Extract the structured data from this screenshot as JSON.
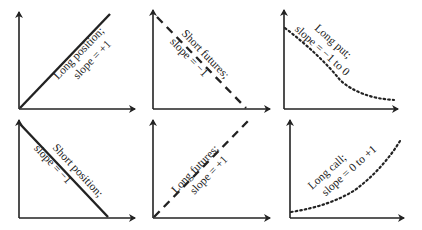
{
  "colors": {
    "ink": "#222222",
    "background": "#ffffff"
  },
  "panels": [
    {
      "id": "long-position",
      "line_style": "solid",
      "label_line1": "Long position;",
      "label_line2": "slope = +1"
    },
    {
      "id": "short-futures",
      "line_style": "dashed",
      "label_line1": "Short futures;",
      "label_line2": "slope = −1"
    },
    {
      "id": "long-put",
      "line_style": "dotted",
      "label_line1": "Long put;",
      "label_line2": "slope = −1 to 0"
    },
    {
      "id": "short-position",
      "line_style": "solid",
      "label_line1": "Short position;",
      "label_line2": "slope = −1"
    },
    {
      "id": "long-futures",
      "line_style": "dashed",
      "label_line1": "Long futures;",
      "label_line2": "slope = +1"
    },
    {
      "id": "long-call",
      "line_style": "dotted",
      "label_line1": "Long call;",
      "label_line2": "slope = 0 to +1"
    }
  ]
}
